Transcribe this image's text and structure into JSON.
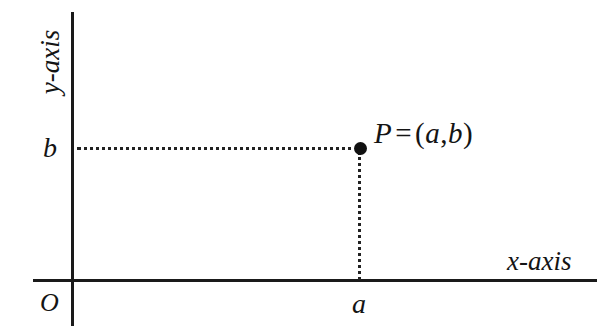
{
  "figure": {
    "type": "cartesian-coordinate-diagram",
    "background_color": "#ffffff",
    "stroke_color": "#1a1a1a",
    "axes": {
      "y_axis_label": "y-axis",
      "x_axis_label": "x-axis",
      "origin_label": "O"
    },
    "ticks": {
      "x_tick_label": "a",
      "y_tick_label": "b"
    },
    "point": {
      "name": "P",
      "equals": "=",
      "open_paren": "(",
      "x_coord": "a",
      "comma": ",",
      "y_coord": "b",
      "close_paren": ")",
      "full_label": "P = (a,b)"
    }
  },
  "chart_data": {
    "type": "scatter",
    "title": "",
    "xlabel": "x-axis",
    "ylabel": "y-axis",
    "grid": false,
    "legend": null,
    "xlim": [
      0,
      1
    ],
    "ylim": [
      0,
      1
    ],
    "xticks": [
      "a"
    ],
    "yticks": [
      "b"
    ],
    "origin": "O",
    "points": [
      {
        "label": "P = (a,b)",
        "x": "a",
        "y": "b"
      }
    ],
    "annotations": [
      {
        "text": "P = (a,b)",
        "kind": "point-label"
      },
      {
        "text": "dotted projection to y-axis at b",
        "kind": "guide-line"
      },
      {
        "text": "dotted projection to x-axis at a",
        "kind": "guide-line"
      }
    ]
  }
}
